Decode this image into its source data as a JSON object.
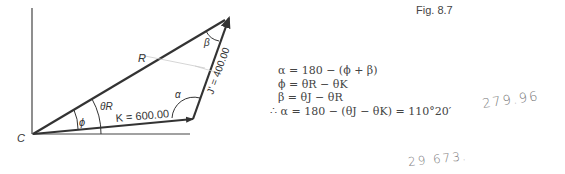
{
  "figure": {
    "label": "Fig. 8.7",
    "origin_label": "C",
    "vectors": {
      "R": {
        "label": "R"
      },
      "K": {
        "label": "K = 600.00"
      },
      "J": {
        "label": "J' = 400.00"
      }
    },
    "angles": {
      "phi": "ϕ",
      "theta_r": "θR",
      "alpha": "α",
      "beta": "β"
    }
  },
  "equations": [
    "α = 180 − (ϕ + β)",
    "ϕ = θR − θK",
    "β = θJ − θR",
    "∴ α = 180 − (θJ − θK) = 110°20′"
  ],
  "handwritten": [
    "279.96",
    "29 673."
  ]
}
